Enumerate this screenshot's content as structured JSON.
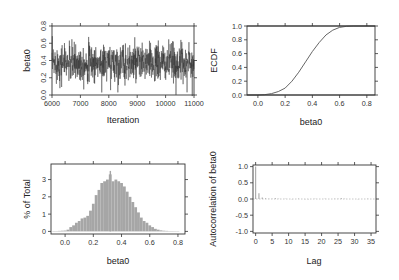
{
  "chart_data": [
    {
      "type": "line",
      "title": "",
      "panel": "trace",
      "xlabel": "Iteration",
      "ylabel": "beta0",
      "xlim": [
        6000,
        11000
      ],
      "ylim": [
        0.0,
        0.8
      ],
      "xticks": [
        "6000",
        "7000",
        "8000",
        "9000",
        "10000",
        "11000"
      ],
      "yticks": [
        "0.0",
        "0.2",
        "0.4",
        "0.6",
        "0.8"
      ],
      "series": [
        {
          "name": "beta0 trace",
          "mean": 0.37,
          "sd": 0.11,
          "n": 5000,
          "min": -0.02,
          "max": 0.75
        }
      ],
      "color": "#333333"
    },
    {
      "type": "line",
      "title": "",
      "panel": "ecdf",
      "xlabel": "beta0",
      "ylabel": "ECDF",
      "xlim": [
        -0.08,
        0.86
      ],
      "ylim": [
        0.0,
        1.0
      ],
      "xticks": [
        "0.0",
        "0.2",
        "0.4",
        "0.6",
        "0.8"
      ],
      "yticks": [
        "0.0",
        "0.2",
        "0.4",
        "0.6",
        "0.8",
        "1.0"
      ],
      "x": [
        -0.08,
        0.0,
        0.05,
        0.1,
        0.15,
        0.2,
        0.25,
        0.3,
        0.35,
        0.4,
        0.45,
        0.5,
        0.55,
        0.6,
        0.65,
        0.7,
        0.75,
        0.86
      ],
      "y": [
        0.0,
        0.0,
        0.005,
        0.02,
        0.05,
        0.1,
        0.2,
        0.33,
        0.48,
        0.63,
        0.76,
        0.87,
        0.94,
        0.98,
        0.995,
        1.0,
        1.0,
        1.0
      ],
      "reference_lines": [
        0.0,
        1.0
      ],
      "color": "#555555"
    },
    {
      "type": "bar",
      "title": "",
      "panel": "histogram",
      "xlabel": "beta0",
      "ylabel": "% of Total",
      "xlim": [
        -0.1,
        0.85
      ],
      "ylim": [
        -0.15,
        3.9
      ],
      "xticks": [
        "0.0",
        "0.2",
        "0.4",
        "0.6",
        "0.8"
      ],
      "yticks": [
        "0",
        "1",
        "2",
        "3"
      ],
      "bin_width": 0.01,
      "x": [
        -0.08,
        -0.06,
        -0.04,
        -0.02,
        0.0,
        0.02,
        0.04,
        0.06,
        0.08,
        0.1,
        0.12,
        0.14,
        0.16,
        0.18,
        0.2,
        0.22,
        0.24,
        0.26,
        0.28,
        0.3,
        0.32,
        0.34,
        0.36,
        0.38,
        0.4,
        0.42,
        0.44,
        0.46,
        0.48,
        0.5,
        0.52,
        0.54,
        0.56,
        0.58,
        0.6,
        0.62,
        0.64,
        0.66,
        0.68,
        0.7,
        0.72,
        0.74,
        0.76,
        0.78,
        0.8
      ],
      "values": [
        0.02,
        0.02,
        0.03,
        0.04,
        0.05,
        0.1,
        0.25,
        0.35,
        0.5,
        0.6,
        0.75,
        0.8,
        0.9,
        1.2,
        1.6,
        2.1,
        2.4,
        2.8,
        2.9,
        3.0,
        3.3,
        2.9,
        3.0,
        2.9,
        2.8,
        2.6,
        2.3,
        2.0,
        1.7,
        1.4,
        1.1,
        0.8,
        0.6,
        0.5,
        0.35,
        0.25,
        0.15,
        0.1,
        0.06,
        0.04,
        0.03,
        0.02,
        0.02,
        0.01,
        0.01
      ],
      "peak": {
        "x": 0.32,
        "value": 3.5
      },
      "color": "#a6a6a6"
    },
    {
      "type": "bar",
      "title": "",
      "panel": "acf",
      "xlabel": "Lag",
      "ylabel": "Autocorrelation of beta0",
      "xlim": [
        -0.8,
        36.5
      ],
      "ylim": [
        -1.05,
        1.05
      ],
      "xticks": [
        "0",
        "5",
        "10",
        "15",
        "20",
        "25",
        "30",
        "35"
      ],
      "yticks": [
        "-1.0",
        "-0.5",
        "0.0",
        "0.5",
        "1.0"
      ],
      "x": [
        0,
        1,
        2,
        3,
        4,
        5,
        6,
        7,
        8,
        9,
        10,
        11,
        12,
        13,
        14,
        15,
        16,
        17,
        18,
        19,
        20,
        21,
        22,
        23,
        24,
        25,
        26,
        27,
        28,
        29,
        30,
        31,
        32,
        33,
        34,
        35,
        36
      ],
      "values": [
        1.0,
        0.18,
        0.05,
        0.02,
        0.01,
        0.01,
        0.02,
        0.01,
        0.0,
        0.01,
        0.0,
        -0.01,
        0.0,
        0.01,
        0.0,
        -0.01,
        -0.01,
        0.0,
        0.01,
        0.0,
        0.0,
        0.01,
        0.0,
        0.0,
        0.01,
        0.01,
        0.02,
        0.01,
        0.0,
        0.0,
        0.0,
        -0.01,
        0.0,
        0.0,
        0.01,
        0.0,
        0.0
      ],
      "zero_line": 0.0,
      "color": "#a6a6a6"
    }
  ]
}
